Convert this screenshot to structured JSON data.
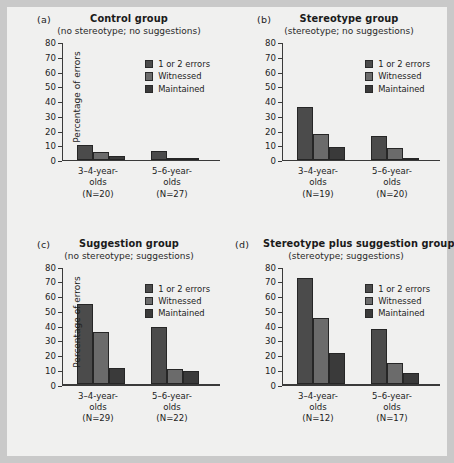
{
  "figure": {
    "background": "#f0f0ef",
    "outer_background": "#c9c9c9",
    "ylabel": "Percentage of errors",
    "yticks": [
      "80",
      "70",
      "60",
      "50",
      "40",
      "30",
      "20",
      "10",
      "0"
    ],
    "series_colors": [
      "#4b4b4b",
      "#6b6b6b",
      "#3a3a3a"
    ]
  },
  "legend": {
    "items": [
      {
        "label": "1 or 2 errors",
        "color": "#4b4b4b"
      },
      {
        "label": "Witnessed",
        "color": "#6b6b6b"
      },
      {
        "label": "Maintained",
        "color": "#3a3a3a"
      }
    ]
  },
  "panels": [
    {
      "letter": "(a)",
      "title": "Control group",
      "subtitle": "(no stereotype; no suggestions)",
      "groups": [
        {
          "line1": "3–4-year-",
          "line2": "olds",
          "line3": "(N=20)"
        },
        {
          "line1": "5–6-year-",
          "line2": "olds",
          "line3": "(N=27)"
        }
      ]
    },
    {
      "letter": "(b)",
      "title": "Stereotype group",
      "subtitle": "(stereotype; no suggestions)",
      "groups": [
        {
          "line1": "3–4-year-",
          "line2": "olds",
          "line3": "(N=19)"
        },
        {
          "line1": "5–6-year-",
          "line2": "olds",
          "line3": "(N=20)"
        }
      ]
    },
    {
      "letter": "(c)",
      "title": "Suggestion group",
      "subtitle": "(no stereotype; suggestions)",
      "groups": [
        {
          "line1": "3–4-year-",
          "line2": "olds",
          "line3": "(N=29)"
        },
        {
          "line1": "5–6-year-",
          "line2": "olds",
          "line3": "(N=22)"
        }
      ]
    },
    {
      "letter": "(d)",
      "title": "Stereotype plus suggestion group",
      "subtitle": "(stereotype; suggestions)",
      "groups": [
        {
          "line1": "3–4-year-",
          "line2": "olds",
          "line3": "(N=12)"
        },
        {
          "line1": "5–6-year-",
          "line2": "olds",
          "line3": "(N=17)"
        }
      ]
    }
  ],
  "chart_data": [
    {
      "type": "bar",
      "title": "Control group",
      "subtitle": "(no stereotype; no suggestions)",
      "panel": "(a)",
      "categories": [
        "3–4-year-olds (N=20)",
        "5–6-year-olds (N=27)"
      ],
      "series": [
        {
          "name": "1 or 2 errors",
          "values": [
            10,
            6
          ]
        },
        {
          "name": "Witnessed",
          "values": [
            5,
            0.7
          ]
        },
        {
          "name": "Maintained",
          "values": [
            2.5,
            0.7
          ]
        }
      ],
      "xlabel": "",
      "ylabel": "Percentage of errors",
      "ylim": [
        0,
        80
      ],
      "ytick_step": 10,
      "grid": false,
      "legend_position": "top-right"
    },
    {
      "type": "bar",
      "title": "Stereotype group",
      "subtitle": "(stereotype; no suggestions)",
      "panel": "(b)",
      "categories": [
        "3–4-year-olds (N=19)",
        "5–6-year-olds (N=20)"
      ],
      "series": [
        {
          "name": "1 or 2 errors",
          "values": [
            35.5,
            16
          ]
        },
        {
          "name": "Witnessed",
          "values": [
            17.5,
            8
          ]
        },
        {
          "name": "Maintained",
          "values": [
            8.5,
            1
          ]
        }
      ],
      "xlabel": "",
      "ylabel": "Percentage of errors",
      "ylim": [
        0,
        80
      ],
      "ytick_step": 10,
      "grid": false,
      "legend_position": "top-right"
    },
    {
      "type": "bar",
      "title": "Suggestion group",
      "subtitle": "(no stereotype; suggestions)",
      "panel": "(c)",
      "categories": [
        "3–4-year-olds (N=29)",
        "5–6-year-olds (N=22)"
      ],
      "series": [
        {
          "name": "1 or 2 errors",
          "values": [
            54.5,
            38.5
          ]
        },
        {
          "name": "Witnessed",
          "values": [
            35,
            10
          ]
        },
        {
          "name": "Maintained",
          "values": [
            11,
            9
          ]
        }
      ],
      "xlabel": "",
      "ylabel": "Percentage of errors",
      "ylim": [
        0,
        80
      ],
      "ytick_step": 10,
      "grid": false,
      "legend_position": "top-right"
    },
    {
      "type": "bar",
      "title": "Stereotype plus suggestion group",
      "subtitle": "(stereotype; suggestions)",
      "panel": "(d)",
      "categories": [
        "3–4-year-olds (N=12)",
        "5–6-year-olds (N=17)"
      ],
      "series": [
        {
          "name": "1 or 2 errors",
          "values": [
            72,
            37.5
          ]
        },
        {
          "name": "Witnessed",
          "values": [
            44.5,
            14
          ]
        },
        {
          "name": "Maintained",
          "values": [
            21,
            7.5
          ]
        }
      ],
      "xlabel": "",
      "ylabel": "Percentage of errors",
      "ylim": [
        0,
        80
      ],
      "ytick_step": 10,
      "grid": false,
      "legend_position": "top-right"
    }
  ]
}
